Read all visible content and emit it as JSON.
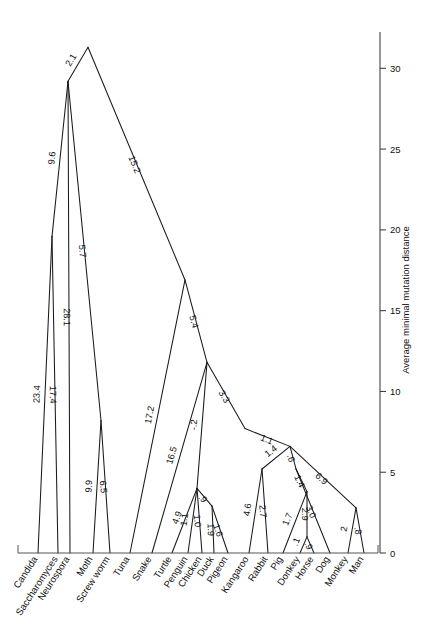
{
  "figure": {
    "background": "#ffffff",
    "line_color": "#1a1a1a"
  },
  "axis": {
    "title": "Average minimal mutation distance",
    "ticks": [
      "0",
      "5",
      "10",
      "15",
      "20",
      "25",
      "30"
    ],
    "tick_values": [
      0,
      5,
      10,
      15,
      20,
      25,
      30
    ],
    "min": 0,
    "max": 32
  },
  "leaves": [
    {
      "name": "Candida",
      "x": 38,
      "branch": "23.4"
    },
    {
      "name": "Saccharomyces",
      "x": 58,
      "branch": "17.4"
    },
    {
      "name": "Neurospora",
      "x": 70,
      "branch": "28.1"
    },
    {
      "name": "Moth",
      "x": 93,
      "branch": "9.9"
    },
    {
      "name": "Screw worm",
      "x": 110,
      "branch": "6.5"
    },
    {
      "name": "Tuna",
      "x": 130,
      "branch": "17.2"
    },
    {
      "name": "Snake",
      "x": 152,
      "branch": "16.5"
    },
    {
      "name": "Turtle",
      "x": 172,
      "branch": "4.9"
    },
    {
      "name": "Penguin",
      "x": 188,
      "branch": "1.1"
    },
    {
      "name": "Chicken",
      "x": 202,
      "branch": "1.0"
    },
    {
      "name": "Duck",
      "x": 214,
      "branch": "1.9"
    },
    {
      "name": "Pigeon",
      "x": 228,
      "branch": "1.6"
    },
    {
      "name": "Kangaroo",
      "x": 249,
      "branch": "4.6"
    },
    {
      "name": "Rabbit",
      "x": 268,
      "branch": "2.7"
    },
    {
      "name": "Pig",
      "x": 283,
      "branch": "1.3"
    },
    {
      "name": "Donkey",
      "x": 300,
      "branch": ".1"
    },
    {
      "name": "Horse",
      "x": 314,
      "branch": ".9"
    },
    {
      "name": "Dog",
      "x": 330,
      "branch": "3.0"
    },
    {
      "name": "Monkey",
      "x": 348,
      "branch": "2"
    },
    {
      "name": "Man",
      "x": 364,
      "branch": ".8"
    }
  ],
  "internal_branches": [
    {
      "id": "root-left",
      "label": "2.1"
    },
    {
      "id": "fungi-upper",
      "label": "9.6"
    },
    {
      "id": "root-right",
      "label": "15.2"
    },
    {
      "id": "insects",
      "label": "5.7"
    },
    {
      "id": "verts",
      "label": "5.4"
    },
    {
      "id": "reptile-bird",
      "label": "-.2"
    },
    {
      "id": "birds-stem",
      "label": "3.3"
    },
    {
      "id": "amniote",
      "label": "3.3"
    },
    {
      "id": "mammals",
      "label": "1.1"
    },
    {
      "id": "bird-crown",
      "label": "1.2"
    },
    {
      "id": "duck-pigeon",
      "label": ".9"
    },
    {
      "id": "mammal-a",
      "label": "1.4"
    },
    {
      "id": "mammal-b",
      "label": ".6"
    },
    {
      "id": "mammal-c",
      "label": "1.4"
    },
    {
      "id": "ungulates",
      "label": "1.7"
    },
    {
      "id": "equids",
      "label": "2.9"
    },
    {
      "id": "primates",
      "label": "6.9"
    }
  ],
  "chart_data": {
    "type": "diagram",
    "ylabel": "Average minimal mutation distance",
    "ylim": [
      0,
      32
    ],
    "yticks": [
      0,
      5,
      10,
      15,
      20,
      25,
      30
    ],
    "xlabel": "",
    "grid": false,
    "legend": null,
    "nodes": [
      {
        "id": "root",
        "x": 88,
        "value": 31.3
      },
      {
        "id": "n_fungi_top",
        "x": 68,
        "value": 29.2
      },
      {
        "id": "n_fungi_low",
        "x": 52,
        "value": 19.6
      },
      {
        "id": "n_insects",
        "x": 101,
        "value": 8.2
      },
      {
        "id": "n_verts",
        "x": 185,
        "value": 16.9
      },
      {
        "id": "n_reptbird",
        "x": 207,
        "value": 11.8
      },
      {
        "id": "n_amniote",
        "x": 245,
        "value": 7.7
      },
      {
        "id": "n_birds",
        "x": 197,
        "value": 4.0
      },
      {
        "id": "n_duckpig",
        "x": 212,
        "value": 2.9
      },
      {
        "id": "n_mammal_a",
        "x": 290,
        "value": 6.6
      },
      {
        "id": "n_mammal_b",
        "x": 262,
        "value": 5.2
      },
      {
        "id": "n_mammal_c",
        "x": 296,
        "value": 5.2
      },
      {
        "id": "n_ungulate",
        "x": 307,
        "value": 3.8
      },
      {
        "id": "n_equid",
        "x": 307,
        "value": 1.0
      },
      {
        "id": "n_primate",
        "x": 356,
        "value": 2.8
      }
    ],
    "edges": [
      {
        "from": "root",
        "to": "n_fungi_top",
        "label": "2.1"
      },
      {
        "from": "n_fungi_top",
        "to": "n_fungi_low",
        "label": "9.6"
      },
      {
        "from": "n_fungi_low",
        "to": "Candida",
        "label": "23.4"
      },
      {
        "from": "n_fungi_low",
        "to": "Saccharomyces",
        "label": "17.4"
      },
      {
        "from": "n_fungi_top",
        "to": "Neurospora",
        "label": "28.1"
      },
      {
        "from": "root",
        "to": "n_verts",
        "label": "15.2"
      },
      {
        "from": "n_fungi_top",
        "to": "n_insects",
        "label": "5.7"
      },
      {
        "from": "n_insects",
        "to": "Moth",
        "label": "9.9"
      },
      {
        "from": "n_insects",
        "to": "Screw worm",
        "label": "6.5"
      },
      {
        "from": "n_verts",
        "to": "Tuna",
        "label": "17.2"
      },
      {
        "from": "n_verts",
        "to": "n_reptbird",
        "label": "5.4"
      },
      {
        "from": "n_reptbird",
        "to": "Snake",
        "label": "16.5"
      },
      {
        "from": "n_reptbird",
        "to": "n_amniote",
        "label": "3.3"
      },
      {
        "from": "n_reptbird",
        "to": "n_birds",
        "label": "-.2"
      },
      {
        "from": "n_birds",
        "to": "Turtle",
        "label": "4.9"
      },
      {
        "from": "n_birds",
        "to": "Penguin",
        "label": "1.1"
      },
      {
        "from": "n_birds",
        "to": "Chicken",
        "label": "1.0"
      },
      {
        "from": "n_birds",
        "to": "n_duckpig",
        "label": ".9"
      },
      {
        "from": "n_duckpig",
        "to": "Duck",
        "label": "1.9"
      },
      {
        "from": "n_duckpig",
        "to": "Pigeon",
        "label": "1.6"
      },
      {
        "from": "n_amniote",
        "to": "n_mammal_a",
        "label": "1.1"
      },
      {
        "from": "n_mammal_a",
        "to": "n_mammal_b",
        "label": "1.4"
      },
      {
        "from": "n_mammal_b",
        "to": "Kangaroo",
        "label": "4.6"
      },
      {
        "from": "n_mammal_b",
        "to": "Rabbit",
        "label": "2.7"
      },
      {
        "from": "n_mammal_a",
        "to": "n_mammal_c",
        "label": ".6"
      },
      {
        "from": "n_mammal_c",
        "to": "n_ungulate",
        "label": "1.4"
      },
      {
        "from": "n_ungulate",
        "to": "Pig",
        "label": "1.7"
      },
      {
        "from": "n_ungulate",
        "to": "n_equid",
        "label": "2.9"
      },
      {
        "from": "n_equid",
        "to": "Donkey",
        "label": ".1"
      },
      {
        "from": "n_equid",
        "to": "Horse",
        "label": ".9"
      },
      {
        "from": "n_mammal_c",
        "to": "Dog",
        "label": "3.0"
      },
      {
        "from": "n_mammal_a",
        "to": "n_primate",
        "label": "6.9"
      },
      {
        "from": "n_primate",
        "to": "Monkey",
        "label": "2"
      },
      {
        "from": "n_primate",
        "to": "Man",
        "label": ".8"
      }
    ]
  }
}
